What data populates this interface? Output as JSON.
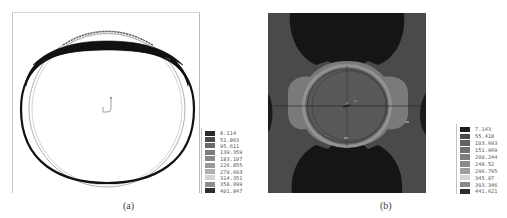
{
  "figure": {
    "panels": [
      {
        "id": "a",
        "caption": "(a)",
        "description": "Deformed ring contour plot (black outline of deformed shell over undeformed ring)",
        "legend": {
          "values": [
            "8.114",
            "51.863",
            "95.611",
            "139.359",
            "183.107",
            "226.855",
            "270.603",
            "314.351",
            "358.099",
            "401.847"
          ],
          "colors": [
            "#2a2a2a",
            "#4c4c4c",
            "#6a6a6a",
            "#7c7c7c",
            "#8a8a8a",
            "#9a9a9a",
            "#b0b0b0",
            "#d4d4d4",
            "#8c8c8c",
            "#303030"
          ]
        }
      },
      {
        "id": "b",
        "caption": "(b)",
        "description": "Grayscale stress contour plot around a circular opening",
        "legend": {
          "values": [
            "7.143",
            "55.418",
            "103.693",
            "151.969",
            "200.244",
            "248.52",
            "296.795",
            "345.07",
            "393.346",
            "441.621"
          ],
          "colors": [
            "#1e1e1e",
            "#4a4a4a",
            "#626262",
            "#707070",
            "#7e7e7e",
            "#8a8a8a",
            "#9e9e9e",
            "#d6d6d6",
            "#8a8a8a",
            "#2e2e2e"
          ]
        },
        "region_colors": {
          "dark": "#151515",
          "background": "#4a4a4a",
          "light_band": "#7a7a7a",
          "ring": "#939393",
          "disc": "#585858"
        }
      }
    ]
  }
}
